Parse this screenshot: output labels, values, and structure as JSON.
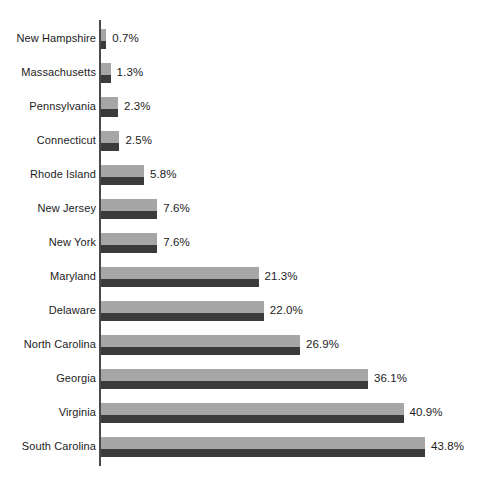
{
  "chart_data": {
    "type": "bar",
    "orientation": "horizontal",
    "title": "",
    "subtitle": "",
    "xlabel": "",
    "ylabel": "",
    "grid": false,
    "legend": null,
    "axis_line": true,
    "value_label_suffix": "%",
    "xlim": [
      0,
      43.8
    ],
    "categories": [
      "New Hampshire",
      "Massachusetts",
      "Pennsylvania",
      "Connecticut",
      "Rhode Island",
      "New Jersey",
      "New York",
      "Maryland",
      "Delaware",
      "North Carolina",
      "Georgia",
      "Virginia",
      "South Carolina"
    ],
    "values": [
      0.7,
      1.3,
      2.3,
      2.5,
      5.8,
      7.6,
      7.6,
      21.3,
      22.0,
      26.9,
      36.1,
      40.9,
      43.8
    ],
    "value_labels": [
      "0.7%",
      "1.3%",
      "2.3%",
      "2.5%",
      "5.8%",
      "7.6%",
      "7.6%",
      "21.3%",
      "22.0%",
      "26.9%",
      "36.1%",
      "40.9%",
      "43.8%"
    ],
    "colors": {
      "bar_light": "#a6a6a6",
      "bar_dark": "#3b3b3b",
      "axis": "#4a4a4a",
      "text": "#1c1c1c",
      "background": "#ffffff"
    }
  }
}
